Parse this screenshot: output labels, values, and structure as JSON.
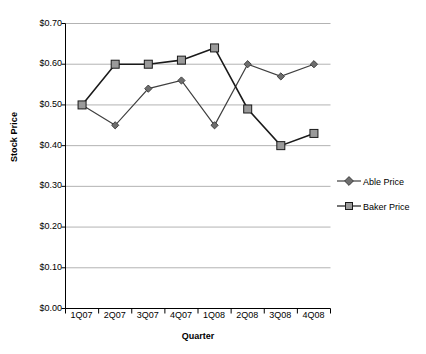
{
  "chart_data": {
    "type": "line",
    "title": "",
    "xlabel": "Quarter",
    "ylabel": "Stock Price",
    "categories": [
      "1Q07",
      "2Q07",
      "3Q07",
      "4Q07",
      "1Q08",
      "2Q08",
      "3Q08",
      "4Q08"
    ],
    "ylim": [
      0.0,
      0.7
    ],
    "ytick_labels": [
      "$0.70",
      "$0.60",
      "$0.50",
      "$0.40",
      "$0.30",
      "$0.20",
      "$0.10",
      "$0.00"
    ],
    "ytick_values": [
      0.7,
      0.6,
      0.5,
      0.4,
      0.3,
      0.2,
      0.1,
      0.0
    ],
    "grid": "horizontal",
    "legend_position": "right",
    "series": [
      {
        "name": "Able Price",
        "marker": "diamond",
        "color": "#3f3f3f",
        "marker_fill": "#6e6e6e",
        "values": [
          0.5,
          0.45,
          0.54,
          0.56,
          0.45,
          0.6,
          0.57,
          0.6
        ]
      },
      {
        "name": "Baker Price",
        "marker": "square",
        "color": "#1a1a1a",
        "marker_fill": "#9a9a9a",
        "values": [
          0.5,
          0.6,
          0.6,
          0.61,
          0.64,
          0.49,
          0.4,
          0.43
        ]
      }
    ]
  },
  "legend": {
    "entries": [
      {
        "label": "Able Price"
      },
      {
        "label": "Baker Price"
      }
    ]
  },
  "colors": {
    "axis": "#000000",
    "grid": "#b3b3b3",
    "background": "#ffffff"
  }
}
